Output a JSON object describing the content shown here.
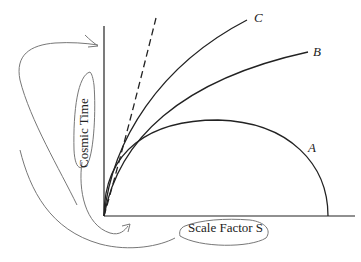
{
  "diagram": {
    "title": "",
    "axes": {
      "y_label": "Cosmic Time",
      "x_label": "Scale Factor S"
    },
    "curves": [
      {
        "id": "A",
        "label": "A",
        "style": "solid",
        "shape": "semicircle (closed universe, recollapses)"
      },
      {
        "id": "B",
        "label": "B",
        "style": "solid",
        "shape": "decelerating expansion"
      },
      {
        "id": "C",
        "label": "C",
        "style": "solid",
        "shape": "faster expansion"
      },
      {
        "id": "dashed",
        "label": "",
        "style": "dashed",
        "shape": "straight line from origin"
      }
    ],
    "annotations": [
      "hand-drawn arrow circling 'Cosmic Time' label pointing to top of vertical axis",
      "hand-drawn arrow from 'Cosmic Time' label pointing to origin",
      "hand-drawn loop around 'Scale Factor S' label"
    ],
    "colors": {
      "axis": "#222222",
      "curve": "#222222",
      "annotation": "#777777"
    }
  }
}
